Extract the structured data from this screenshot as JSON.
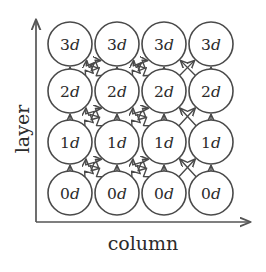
{
  "figure": {
    "title": "",
    "axes": {
      "x_label": "column",
      "y_label": "layer",
      "x_arrow": "right-arrow-icon",
      "y_arrow": "up-arrow-icon"
    },
    "colors": {
      "stroke": "#4a4a4a",
      "text": "#2b2b2b",
      "background": "#ffffff",
      "axis": "#555555"
    },
    "grid": {
      "rows": 4,
      "columns": 4,
      "row_labels_bottom_to_top": [
        "0d",
        "1d",
        "2d",
        "3d"
      ]
    },
    "nodes": [
      {
        "id": "n-r0-c0",
        "row": 0,
        "col": 0,
        "prefix": "0",
        "suffix": "d"
      },
      {
        "id": "n-r0-c1",
        "row": 0,
        "col": 1,
        "prefix": "0",
        "suffix": "d"
      },
      {
        "id": "n-r0-c2",
        "row": 0,
        "col": 2,
        "prefix": "0",
        "suffix": "d"
      },
      {
        "id": "n-r0-c3",
        "row": 0,
        "col": 3,
        "prefix": "0",
        "suffix": "d"
      },
      {
        "id": "n-r1-c0",
        "row": 1,
        "col": 0,
        "prefix": "1",
        "suffix": "d"
      },
      {
        "id": "n-r1-c1",
        "row": 1,
        "col": 1,
        "prefix": "1",
        "suffix": "d"
      },
      {
        "id": "n-r1-c2",
        "row": 1,
        "col": 2,
        "prefix": "1",
        "suffix": "d"
      },
      {
        "id": "n-r1-c3",
        "row": 1,
        "col": 3,
        "prefix": "1",
        "suffix": "d"
      },
      {
        "id": "n-r2-c0",
        "row": 2,
        "col": 0,
        "prefix": "2",
        "suffix": "d"
      },
      {
        "id": "n-r2-c1",
        "row": 2,
        "col": 1,
        "prefix": "2",
        "suffix": "d"
      },
      {
        "id": "n-r2-c2",
        "row": 2,
        "col": 2,
        "prefix": "2",
        "suffix": "d"
      },
      {
        "id": "n-r2-c3",
        "row": 2,
        "col": 3,
        "prefix": "2",
        "suffix": "d"
      },
      {
        "id": "n-r3-c0",
        "row": 3,
        "col": 0,
        "prefix": "3",
        "suffix": "d"
      },
      {
        "id": "n-r3-c1",
        "row": 3,
        "col": 1,
        "prefix": "3",
        "suffix": "d"
      },
      {
        "id": "n-r3-c2",
        "row": 3,
        "col": 2,
        "prefix": "3",
        "suffix": "d"
      },
      {
        "id": "n-r3-c3",
        "row": 3,
        "col": 3,
        "prefix": "3",
        "suffix": "d"
      }
    ],
    "edges": [
      {
        "from_row": 0,
        "from_col": 0,
        "to_row": 1,
        "to_col": 0,
        "style": "straight"
      },
      {
        "from_row": 0,
        "from_col": 1,
        "to_row": 1,
        "to_col": 1,
        "style": "straight"
      },
      {
        "from_row": 0,
        "from_col": 2,
        "to_row": 1,
        "to_col": 2,
        "style": "straight"
      },
      {
        "from_row": 0,
        "from_col": 3,
        "to_row": 1,
        "to_col": 3,
        "style": "straight"
      },
      {
        "from_row": 1,
        "from_col": 0,
        "to_row": 2,
        "to_col": 0,
        "style": "straight"
      },
      {
        "from_row": 1,
        "from_col": 1,
        "to_row": 2,
        "to_col": 1,
        "style": "straight"
      },
      {
        "from_row": 1,
        "from_col": 2,
        "to_row": 2,
        "to_col": 2,
        "style": "straight"
      },
      {
        "from_row": 1,
        "from_col": 3,
        "to_row": 2,
        "to_col": 3,
        "style": "straight"
      },
      {
        "from_row": 2,
        "from_col": 0,
        "to_row": 3,
        "to_col": 0,
        "style": "straight"
      },
      {
        "from_row": 2,
        "from_col": 1,
        "to_row": 3,
        "to_col": 1,
        "style": "straight"
      },
      {
        "from_row": 2,
        "from_col": 2,
        "to_row": 3,
        "to_col": 2,
        "style": "straight"
      },
      {
        "from_row": 2,
        "from_col": 3,
        "to_row": 3,
        "to_col": 3,
        "style": "straight"
      },
      {
        "from_row": 0,
        "from_col": 0,
        "to_row": 1,
        "to_col": 1,
        "style": "zigzag"
      },
      {
        "from_row": 0,
        "from_col": 1,
        "to_row": 1,
        "to_col": 0,
        "style": "zigzag"
      },
      {
        "from_row": 0,
        "from_col": 1,
        "to_row": 1,
        "to_col": 2,
        "style": "zigzag"
      },
      {
        "from_row": 0,
        "from_col": 2,
        "to_row": 1,
        "to_col": 1,
        "style": "zigzag"
      },
      {
        "from_row": 0,
        "from_col": 2,
        "to_row": 1,
        "to_col": 3,
        "style": "straight"
      },
      {
        "from_row": 0,
        "from_col": 3,
        "to_row": 1,
        "to_col": 2,
        "style": "straight"
      },
      {
        "from_row": 1,
        "from_col": 0,
        "to_row": 2,
        "to_col": 1,
        "style": "zigzag"
      },
      {
        "from_row": 1,
        "from_col": 1,
        "to_row": 2,
        "to_col": 0,
        "style": "zigzag"
      },
      {
        "from_row": 1,
        "from_col": 1,
        "to_row": 2,
        "to_col": 2,
        "style": "zigzag"
      },
      {
        "from_row": 1,
        "from_col": 2,
        "to_row": 2,
        "to_col": 1,
        "style": "zigzag"
      },
      {
        "from_row": 1,
        "from_col": 2,
        "to_row": 2,
        "to_col": 3,
        "style": "straight"
      },
      {
        "from_row": 1,
        "from_col": 3,
        "to_row": 2,
        "to_col": 2,
        "style": "straight"
      },
      {
        "from_row": 2,
        "from_col": 0,
        "to_row": 3,
        "to_col": 1,
        "style": "zigzag"
      },
      {
        "from_row": 2,
        "from_col": 1,
        "to_row": 3,
        "to_col": 0,
        "style": "zigzag"
      },
      {
        "from_row": 2,
        "from_col": 1,
        "to_row": 3,
        "to_col": 2,
        "style": "zigzag"
      },
      {
        "from_row": 2,
        "from_col": 2,
        "to_row": 3,
        "to_col": 1,
        "style": "zigzag"
      },
      {
        "from_row": 2,
        "from_col": 2,
        "to_row": 3,
        "to_col": 3,
        "style": "straight"
      },
      {
        "from_row": 2,
        "from_col": 3,
        "to_row": 3,
        "to_col": 2,
        "style": "straight"
      }
    ]
  }
}
